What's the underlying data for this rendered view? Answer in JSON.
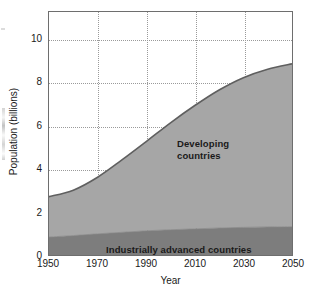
{
  "chart_data": {
    "type": "area",
    "title": "",
    "xlabel": "Year",
    "ylabel": "Population (billions)",
    "xlim": [
      1950,
      2050
    ],
    "ylim": [
      0,
      11.25
    ],
    "grid": true,
    "stacked": true,
    "legend_position": "inline-annotations",
    "xticks": [
      1950,
      1970,
      1990,
      2010,
      2030,
      2050
    ],
    "yticks": [
      0,
      2,
      4,
      6,
      8,
      10
    ],
    "x": [
      1950,
      1960,
      1970,
      1980,
      1990,
      2000,
      2010,
      2020,
      2030,
      2040,
      2050
    ],
    "series": [
      {
        "name": "Industrially advanced countries",
        "color": "#7d7d7d",
        "values": [
          0.83,
          0.9,
          0.98,
          1.05,
          1.12,
          1.17,
          1.21,
          1.25,
          1.28,
          1.3,
          1.31
        ]
      },
      {
        "name": "Developing countries",
        "color": "#a6a6a6",
        "values": [
          1.87,
          2.1,
          2.62,
          3.35,
          4.13,
          4.95,
          5.71,
          6.39,
          6.93,
          7.3,
          7.54
        ]
      }
    ],
    "totals": [
      2.7,
      3.0,
      3.6,
      4.4,
      5.25,
      6.12,
      6.92,
      7.64,
      8.21,
      8.6,
      8.85
    ],
    "annotations": [
      {
        "text": "Developing\ncountries",
        "line1": "Developing",
        "line2": "countries"
      },
      {
        "text": "Industrially advanced countries"
      }
    ],
    "colors": {
      "developing_fill": "#a6a6a6",
      "industrial_fill": "#7d7d7d",
      "curve_line": "#5f5f5f",
      "frame": "#6e6e6e",
      "grid": "#9a9a9a",
      "text": "#1a1a1a",
      "background": "#ffffff"
    }
  },
  "axes": {
    "y_title": "Population (billions)",
    "x_title": "Year",
    "y_ticks": [
      {
        "label": "10",
        "value": 10
      },
      {
        "label": "8",
        "value": 8
      },
      {
        "label": "6",
        "value": 6
      },
      {
        "label": "4",
        "value": 4
      },
      {
        "label": "2",
        "value": 2
      },
      {
        "label": "0",
        "value": 0
      }
    ],
    "x_ticks": [
      {
        "label": "1950",
        "value": 1950
      },
      {
        "label": "1970",
        "value": 1970
      },
      {
        "label": "1990",
        "value": 1990
      },
      {
        "label": "2010",
        "value": 2010
      },
      {
        "label": "2030",
        "value": 2030
      },
      {
        "label": "2050",
        "value": 2050
      }
    ]
  },
  "labels": {
    "developing_line1": "Developing",
    "developing_line2": "countries",
    "industrial": "Industrially advanced countries"
  }
}
